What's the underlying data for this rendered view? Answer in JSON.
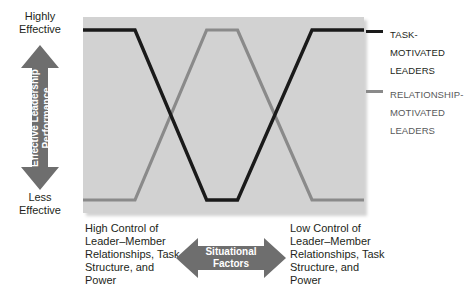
{
  "chart_data": {
    "type": "line",
    "title": "",
    "xlabel": "Situational Factors",
    "ylabel": "Effective Leadership Performance",
    "ylim": [
      0,
      1
    ],
    "ytick_labels": [
      "Highly Effective",
      "Less Effective"
    ],
    "xtick_labels": [
      "High Control of Leader–Member Relationships, Task Structure, and Power",
      "Low Control of Leader–Member Relationships, Task Structure, and Power"
    ],
    "grid": false,
    "legend_position": "right",
    "x": [
      0,
      0.185,
      0.44,
      0.55,
      0.815,
      1.0
    ],
    "series": [
      {
        "name": "TASK-MOTIVATED LEADERS",
        "color": "#1a1a1a",
        "values": [
          1,
          1,
          0,
          0,
          1,
          1
        ]
      },
      {
        "name": "RELATIONSHIP-MOTIVATED LEADERS",
        "color": "#8a8a8a",
        "values": [
          0,
          0,
          1,
          1,
          0,
          0
        ]
      }
    ]
  },
  "axis": {
    "y_top": "Highly\nEffective",
    "y_top_line1": "Highly",
    "y_top_line2": "Effective",
    "y_bottom_line1": "Less",
    "y_bottom_line2": "Effective",
    "y_arrow_line1": "Effective Leadership",
    "y_arrow_line2": "Performance",
    "x_left": "High Control of Leader–Member Relationships, Task Structure, and Power",
    "x_right": "Low Control of Leader–Member Relationships, Task Structure, and Power",
    "x_arrow_line1": "Situational",
    "x_arrow_line2": "Factors"
  },
  "legend": {
    "items": [
      {
        "label_line1": "TASK-",
        "label_line2": "MOTIVATED",
        "label_line3": "LEADERS",
        "color": "#1a1a1a",
        "text_color": "#231f20"
      },
      {
        "label_line1": "RELATIONSHIP-",
        "label_line2": "MOTIVATED",
        "label_line3": "LEADERS",
        "color": "#8a8a8a",
        "text_color": "#58595b"
      }
    ]
  },
  "colors": {
    "panel_background": "#d2d2d2",
    "arrow_fill": "#6e6e6e",
    "task_line": "#1a1a1a",
    "relationship_line": "#8a8a8a",
    "page_background": "#ffffff"
  }
}
